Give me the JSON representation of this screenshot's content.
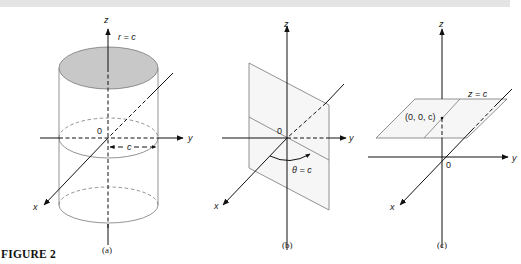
{
  "figure": {
    "caption": "FIGURE 2",
    "background_bar_color": "#e4e4e4",
    "line_color": "#111111",
    "surface_line_color": "#777777",
    "cap_fill_color": "#c8c8c8",
    "panels": [
      {
        "id": "a",
        "label": "(a)",
        "description": "Cylinder r = c",
        "axis_labels": {
          "z": "z",
          "y": "y",
          "x": "x",
          "origin": "0"
        },
        "surface_label": "r = c",
        "radius_label": "c"
      },
      {
        "id": "b",
        "label": "(b)",
        "description": "Half-plane θ = c",
        "axis_labels": {
          "z": "z",
          "y": "y",
          "x": "x",
          "origin": "0"
        },
        "surface_label": "θ = c"
      },
      {
        "id": "c",
        "label": "(c)",
        "description": "Plane z = c",
        "axis_labels": {
          "z": "z",
          "y": "y",
          "x": "x",
          "origin": "0"
        },
        "surface_label": "z = c",
        "point_label": "(0, 0, c)"
      }
    ]
  }
}
